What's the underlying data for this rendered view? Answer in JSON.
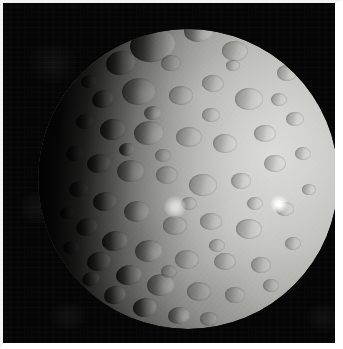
{
  "image": {
    "subject": "Ceres",
    "subject_type": "dwarf planet",
    "source_mission": "Dawn spacecraft",
    "view": "sunlit gibbous disk with terminator on the left limb",
    "alt_text": "Grayscale photograph of the heavily cratered dwarf planet Ceres against black space, lit from the right with a shadowed terminator along the left edge",
    "width_px": 343,
    "height_px": 349,
    "colors": {
      "space_background": "#050506",
      "frame_border": "#f2f2f2",
      "highlight_terrain": "#dcdcd9",
      "midtone_terrain": "#b0b0ad",
      "shadow_terrain": "#2a2a29",
      "facula_white": "#ffffff"
    }
  },
  "disk": {
    "center_x": 185,
    "center_y": 176,
    "radius": 150,
    "light_direction": "right",
    "terminator_side": "left"
  },
  "faculae": [
    {
      "name": "bright-spot-central",
      "x": 172,
      "y": 204,
      "size": 11
    },
    {
      "name": "bright-spot-eastern",
      "x": 276,
      "y": 201,
      "size": 9
    }
  ],
  "craters": [
    {
      "x": 150,
      "y": 42,
      "w": 46,
      "h": 34,
      "r": -8,
      "style": "deep"
    },
    {
      "x": 196,
      "y": 28,
      "w": 30,
      "h": 22,
      "r": -4,
      "style": ""
    },
    {
      "x": 232,
      "y": 48,
      "w": 26,
      "h": 20,
      "r": 2,
      "style": "shallow"
    },
    {
      "x": 258,
      "y": 30,
      "w": 20,
      "h": 15,
      "r": 0,
      "style": "shallow"
    },
    {
      "x": 118,
      "y": 60,
      "w": 30,
      "h": 24,
      "r": -12,
      "style": "deep"
    },
    {
      "x": 96,
      "y": 46,
      "w": 20,
      "h": 16,
      "r": -10,
      "style": "deep"
    },
    {
      "x": 136,
      "y": 88,
      "w": 34,
      "h": 27,
      "r": -6,
      "style": ""
    },
    {
      "x": 178,
      "y": 92,
      "w": 24,
      "h": 19,
      "r": 0,
      "style": "shallow"
    },
    {
      "x": 210,
      "y": 80,
      "w": 22,
      "h": 17,
      "r": 3,
      "style": "shallow"
    },
    {
      "x": 246,
      "y": 96,
      "w": 28,
      "h": 22,
      "r": -2,
      "style": "shallow"
    },
    {
      "x": 284,
      "y": 70,
      "w": 20,
      "h": 16,
      "r": 0,
      "style": "shallow"
    },
    {
      "x": 100,
      "y": 96,
      "w": 22,
      "h": 18,
      "r": -14,
      "style": "deep"
    },
    {
      "x": 82,
      "y": 118,
      "w": 18,
      "h": 15,
      "r": -12,
      "style": "deep"
    },
    {
      "x": 110,
      "y": 126,
      "w": 26,
      "h": 21,
      "r": -8,
      "style": "deep"
    },
    {
      "x": 146,
      "y": 130,
      "w": 30,
      "h": 24,
      "r": -5,
      "style": ""
    },
    {
      "x": 186,
      "y": 134,
      "w": 26,
      "h": 20,
      "r": 0,
      "style": "shallow"
    },
    {
      "x": 222,
      "y": 140,
      "w": 24,
      "h": 19,
      "r": 2,
      "style": "shallow"
    },
    {
      "x": 262,
      "y": 130,
      "w": 22,
      "h": 17,
      "r": 0,
      "style": "shallow"
    },
    {
      "x": 292,
      "y": 116,
      "w": 18,
      "h": 14,
      "r": 0,
      "style": "shallow"
    },
    {
      "x": 72,
      "y": 150,
      "w": 18,
      "h": 15,
      "r": -14,
      "style": "deep"
    },
    {
      "x": 96,
      "y": 160,
      "w": 24,
      "h": 19,
      "r": -10,
      "style": "deep"
    },
    {
      "x": 128,
      "y": 168,
      "w": 28,
      "h": 22,
      "r": -6,
      "style": ""
    },
    {
      "x": 164,
      "y": 172,
      "w": 22,
      "h": 18,
      "r": 0,
      "style": "shallow"
    },
    {
      "x": 200,
      "y": 182,
      "w": 28,
      "h": 22,
      "r": 2,
      "style": "shallow"
    },
    {
      "x": 238,
      "y": 178,
      "w": 20,
      "h": 16,
      "r": 0,
      "style": "shallow"
    },
    {
      "x": 272,
      "y": 160,
      "w": 22,
      "h": 17,
      "r": 0,
      "style": "shallow"
    },
    {
      "x": 300,
      "y": 150,
      "w": 16,
      "h": 13,
      "r": 0,
      "style": "shallow"
    },
    {
      "x": 76,
      "y": 186,
      "w": 20,
      "h": 16,
      "r": -14,
      "style": "deep"
    },
    {
      "x": 102,
      "y": 198,
      "w": 24,
      "h": 19,
      "r": -10,
      "style": "deep"
    },
    {
      "x": 134,
      "y": 208,
      "w": 26,
      "h": 21,
      "r": -6,
      "style": ""
    },
    {
      "x": 172,
      "y": 222,
      "w": 24,
      "h": 19,
      "r": 0,
      "style": "shallow"
    },
    {
      "x": 208,
      "y": 218,
      "w": 22,
      "h": 17,
      "r": 0,
      "style": "shallow"
    },
    {
      "x": 246,
      "y": 226,
      "w": 26,
      "h": 20,
      "r": 2,
      "style": "shallow"
    },
    {
      "x": 282,
      "y": 206,
      "w": 18,
      "h": 14,
      "r": 0,
      "style": "shallow"
    },
    {
      "x": 84,
      "y": 224,
      "w": 22,
      "h": 18,
      "r": -14,
      "style": "deep"
    },
    {
      "x": 112,
      "y": 238,
      "w": 26,
      "h": 20,
      "r": -10,
      "style": "deep"
    },
    {
      "x": 146,
      "y": 248,
      "w": 28,
      "h": 22,
      "r": -6,
      "style": ""
    },
    {
      "x": 184,
      "y": 256,
      "w": 24,
      "h": 19,
      "r": 0,
      "style": "shallow"
    },
    {
      "x": 222,
      "y": 258,
      "w": 22,
      "h": 17,
      "r": 0,
      "style": "shallow"
    },
    {
      "x": 258,
      "y": 262,
      "w": 20,
      "h": 16,
      "r": 0,
      "style": "shallow"
    },
    {
      "x": 96,
      "y": 258,
      "w": 24,
      "h": 19,
      "r": -14,
      "style": "deep"
    },
    {
      "x": 126,
      "y": 272,
      "w": 26,
      "h": 20,
      "r": -10,
      "style": "deep"
    },
    {
      "x": 158,
      "y": 282,
      "w": 28,
      "h": 22,
      "r": -6,
      "style": ""
    },
    {
      "x": 196,
      "y": 288,
      "w": 24,
      "h": 19,
      "r": 0,
      "style": "shallow"
    },
    {
      "x": 232,
      "y": 292,
      "w": 20,
      "h": 16,
      "r": 0,
      "style": "shallow"
    },
    {
      "x": 112,
      "y": 292,
      "w": 22,
      "h": 18,
      "r": -14,
      "style": "deep"
    },
    {
      "x": 142,
      "y": 304,
      "w": 24,
      "h": 19,
      "r": -10,
      "style": "deep"
    },
    {
      "x": 176,
      "y": 312,
      "w": 22,
      "h": 17,
      "r": -6,
      "style": ""
    },
    {
      "x": 206,
      "y": 316,
      "w": 18,
      "h": 14,
      "r": 0,
      "style": "shallow"
    },
    {
      "x": 64,
      "y": 210,
      "w": 14,
      "h": 12,
      "r": -16,
      "style": "deep"
    },
    {
      "x": 68,
      "y": 244,
      "w": 16,
      "h": 13,
      "r": -16,
      "style": "deep"
    },
    {
      "x": 88,
      "y": 276,
      "w": 18,
      "h": 14,
      "r": -16,
      "style": "deep"
    },
    {
      "x": 106,
      "y": 314,
      "w": 16,
      "h": 13,
      "r": -14,
      "style": "deep"
    },
    {
      "x": 86,
      "y": 78,
      "w": 16,
      "h": 13,
      "r": -14,
      "style": "deep"
    },
    {
      "x": 128,
      "y": 24,
      "w": 18,
      "h": 14,
      "r": -10,
      "style": "deep"
    },
    {
      "x": 168,
      "y": 60,
      "w": 20,
      "h": 16,
      "r": -4,
      "style": "shallow"
    },
    {
      "x": 208,
      "y": 112,
      "w": 18,
      "h": 14,
      "r": 0,
      "style": "shallow"
    },
    {
      "x": 252,
      "y": 200,
      "w": 16,
      "h": 13,
      "r": 0,
      "style": "shallow"
    },
    {
      "x": 290,
      "y": 240,
      "w": 16,
      "h": 13,
      "r": 0,
      "style": "shallow"
    },
    {
      "x": 268,
      "y": 282,
      "w": 16,
      "h": 13,
      "r": 0,
      "style": "shallow"
    },
    {
      "x": 306,
      "y": 186,
      "w": 14,
      "h": 11,
      "r": 0,
      "style": "shallow"
    },
    {
      "x": 160,
      "y": 152,
      "w": 16,
      "h": 13,
      "r": 0,
      "style": "shallow"
    },
    {
      "x": 186,
      "y": 200,
      "w": 16,
      "h": 13,
      "r": 0,
      "style": "shallow"
    },
    {
      "x": 124,
      "y": 146,
      "w": 16,
      "h": 13,
      "r": -8,
      "style": "deep"
    },
    {
      "x": 150,
      "y": 110,
      "w": 18,
      "h": 14,
      "r": -4,
      "style": ""
    },
    {
      "x": 230,
      "y": 62,
      "w": 14,
      "h": 11,
      "r": 0,
      "style": "shallow"
    },
    {
      "x": 276,
      "y": 96,
      "w": 16,
      "h": 13,
      "r": 0,
      "style": "shallow"
    },
    {
      "x": 214,
      "y": 242,
      "w": 16,
      "h": 13,
      "r": 0,
      "style": "shallow"
    },
    {
      "x": 166,
      "y": 268,
      "w": 16,
      "h": 13,
      "r": 0,
      "style": "shallow"
    }
  ],
  "sky_blotches": [
    {
      "x": 20,
      "y": 40,
      "w": 60,
      "h": 40
    },
    {
      "x": 10,
      "y": 190,
      "w": 50,
      "h": 30
    },
    {
      "x": 300,
      "y": 300,
      "w": 40,
      "h": 30
    },
    {
      "x": 40,
      "y": 300,
      "w": 50,
      "h": 26
    }
  ]
}
